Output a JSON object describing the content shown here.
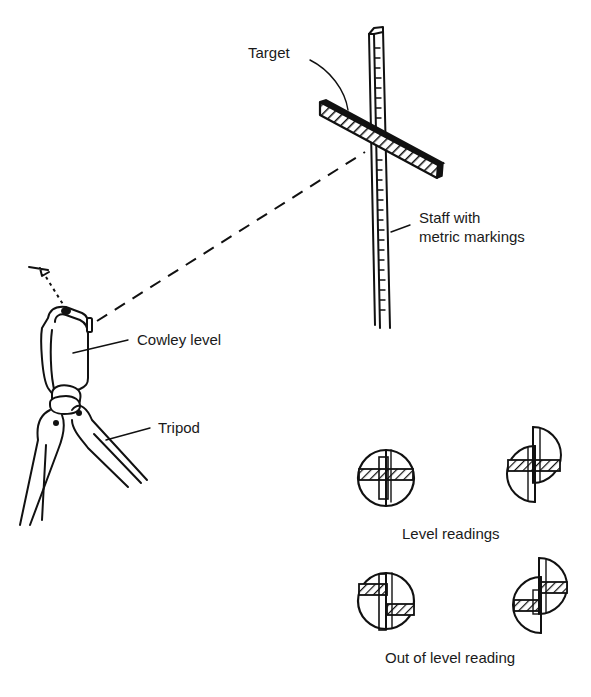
{
  "figure": {
    "type": "technical illustration",
    "colors": {
      "ink": "#111111",
      "background": "#ffffff"
    }
  },
  "labels": {
    "target": "Target",
    "staff_line1": "Staff with",
    "staff_line2": "metric markings",
    "cowley_level": "Cowley level",
    "tripod": "Tripod",
    "level_readings": "Level readings",
    "out_of_level": "Out of level reading"
  },
  "components": [
    {
      "name": "staff",
      "description": "Vertical staff with metric tick markings"
    },
    {
      "name": "target",
      "description": "Hatched crossbar mounted on staff"
    },
    {
      "name": "sight-line",
      "description": "Dashed line from level to target"
    },
    {
      "name": "eye",
      "description": "Observer eye with dotted line into level"
    },
    {
      "name": "cowley-level",
      "description": "Instrument body mounted on tripod"
    },
    {
      "name": "tripod",
      "description": "Three-legged stand"
    }
  ],
  "readings": {
    "level": [
      {
        "id": "level-reading-1",
        "shape": "full circle, aligned halves"
      },
      {
        "id": "level-reading-2",
        "shape": "split halves offset, bars aligned"
      }
    ],
    "out_of_level": [
      {
        "id": "out-of-level-reading-1",
        "shape": "full circle, bars misaligned"
      },
      {
        "id": "out-of-level-reading-2",
        "shape": "split halves offset, bars misaligned"
      }
    ]
  }
}
